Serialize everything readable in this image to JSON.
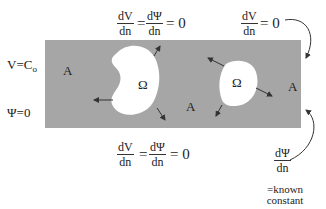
{
  "diagram": {
    "type": "boundary-value-problem-domain",
    "background_color": "#ffffff",
    "domain_fill": "#a6a6a6",
    "hole_fill": "#ffffff",
    "regions": {
      "domain_label": "A",
      "hole_label": "Ω"
    },
    "left_boundary": {
      "condition_1": "V=C",
      "condition_1_sub": "o",
      "condition_2": "Ψ=0"
    },
    "top_boundary_hole": {
      "num_left": "dV",
      "den_left": "dn",
      "equals": "=",
      "num_right": "dΨ",
      "den_right": "dn",
      "rhs": "= 0"
    },
    "top_right_boundary": {
      "num": "dV",
      "den": "dn",
      "rhs": "= 0"
    },
    "bottom_boundary": {
      "num_left": "dV",
      "den_left": "dn",
      "equals": "=",
      "num_right": "dΨ",
      "den_right": "dn",
      "rhs": "= 0"
    },
    "right_boundary": {
      "num": "dΨ",
      "den": "dn",
      "note_line1": "=known",
      "note_line2": "constant"
    }
  }
}
